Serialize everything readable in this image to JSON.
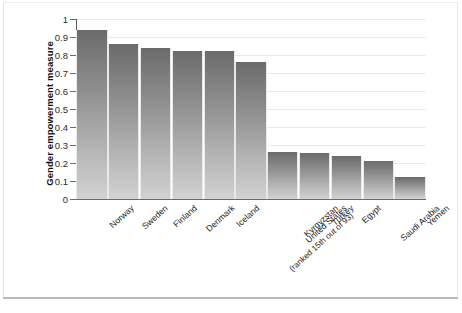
{
  "chart_data": {
    "type": "bar",
    "title": "",
    "subtitle": "",
    "xlabel": "",
    "ylabel": "Gender empowerment measure",
    "ylim": [
      0,
      1
    ],
    "ytick_labels": [
      "1",
      "0.9",
      "0.8",
      "0.7",
      "0.6",
      "0.5",
      "0.4",
      "0.3",
      "0.2",
      "0.1",
      "0"
    ],
    "ytick_values": [
      1,
      0.9,
      0.8,
      0.7,
      0.6,
      0.5,
      0.4,
      0.3,
      0.2,
      0.1,
      0
    ],
    "grid": true,
    "grid_axis": "y",
    "legend": false,
    "legend_position": "none",
    "categories": [
      "Norway",
      "Sweden",
      "Finland",
      "Denmark",
      "Iceland",
      "United States",
      "Kyrgyzstan",
      "Turkey",
      "Egypt",
      "Saudi Arabia",
      "Yemen"
    ],
    "category_annotations": [
      "",
      "",
      "",
      "",
      "",
      "(ranked 15th out of 93)",
      "",
      "",
      "",
      "",
      ""
    ],
    "values": [
      0.94,
      0.86,
      0.84,
      0.82,
      0.82,
      0.76,
      0.26,
      0.255,
      0.24,
      0.21,
      0.12
    ],
    "bar_color_top": "#6b6b6b",
    "bar_color_bottom": "#d2d2d2",
    "axis_color": "#5a5a5a",
    "grid_color": "#eaeaea",
    "background": "#ffffff"
  }
}
